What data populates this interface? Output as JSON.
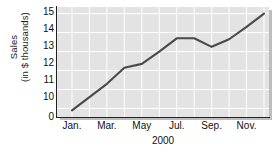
{
  "chart_data": {
    "type": "line",
    "title": "",
    "xlabel": "2000",
    "ylabel_lines": [
      "Sales",
      "(in $ thousands)"
    ],
    "ylabel": "Sales (in $ thousands)",
    "categories": [
      "Jan.",
      "Feb.",
      "Mar.",
      "Apr.",
      "May",
      "Jun.",
      "Jul.",
      "Aug.",
      "Sep.",
      "Oct.",
      "Nov.",
      "Dec."
    ],
    "x_tick_labels": [
      "Jan.",
      "Mar.",
      "May",
      "Jul.",
      "Sep.",
      "Nov."
    ],
    "x_tick_indices": [
      0,
      2,
      4,
      6,
      8,
      10
    ],
    "values": [
      9.9,
      10.6,
      11.3,
      12.15,
      12.35,
      13.0,
      13.7,
      13.7,
      13.25,
      13.65,
      14.3,
      15.0
    ],
    "y_tick_labels": [
      "15",
      "14",
      "13",
      "12",
      "11",
      "10",
      "0"
    ],
    "y_tick_values": [
      15,
      14,
      13,
      12,
      11,
      10,
      0
    ],
    "ylim": [
      9.6,
      15.2
    ],
    "axis_break": true,
    "grid": true,
    "legend": "none",
    "series_color": "#4a4a4a",
    "plot_background": "#e3e3e3",
    "grid_color": "#ffffff"
  }
}
